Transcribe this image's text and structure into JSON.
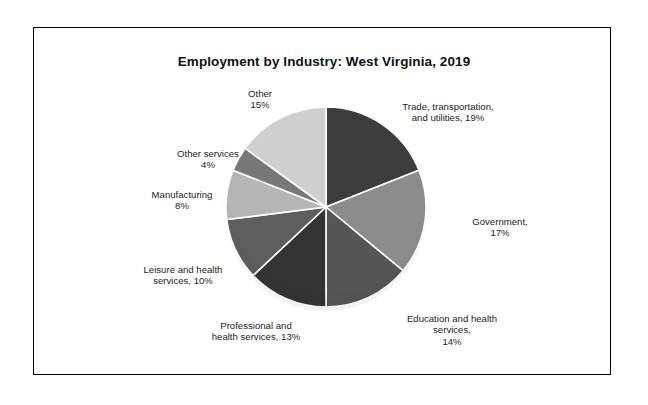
{
  "figure": {
    "title": "Employment by Industry: West Virginia, 2019",
    "background": "#ffffff",
    "border_color": "#000000"
  },
  "chart_data": {
    "type": "pie",
    "title": "Employment by Industry: West Virginia, 2019",
    "xlabel": "",
    "ylabel": "",
    "legend_position": "none",
    "label_style": "outside-radial",
    "start_angle_deg": 0,
    "direction": "clockwise",
    "units": "percent",
    "categories": [
      "Trade, transportation, and utilities",
      "Government",
      "Education and health services",
      "Professional and health services",
      "Leisure and health services",
      "Manufacturing",
      "Other services",
      "Other"
    ],
    "values": [
      19,
      17,
      14,
      13,
      10,
      8,
      4,
      15
    ],
    "total": 100,
    "colors": [
      "#3d3d3d",
      "#8c8c8c",
      "#565656",
      "#343434",
      "#5e5e5e",
      "#b5b5b5",
      "#787878",
      "#cfcfcf"
    ],
    "slice_labels": [
      "Trade, transportation,\nand utilities, 19%",
      "Government,\n17%",
      "Education and health\nservices,\n14%",
      "Professional and\nhealth services, 13%",
      "Leisure and health\nservices, 10%",
      "Manufacturing\n8%",
      "Other services\n4%",
      "Other\n15%"
    ],
    "slices": [
      {
        "name": "Trade, transportation, and utilities",
        "value": 19,
        "label": "Trade, transportation,\nand utilities, 19%",
        "color": "#3d3d3d"
      },
      {
        "name": "Government",
        "value": 17,
        "label": "Government,\n17%",
        "color": "#8c8c8c"
      },
      {
        "name": "Education and health services",
        "value": 14,
        "label": "Education and health\nservices,\n14%",
        "color": "#565656"
      },
      {
        "name": "Professional and health services",
        "value": 13,
        "label": "Professional and\nhealth services, 13%",
        "color": "#343434"
      },
      {
        "name": "Leisure and health services",
        "value": 10,
        "label": "Leisure and health\nservices, 10%",
        "color": "#5e5e5e"
      },
      {
        "name": "Manufacturing",
        "value": 8,
        "label": "Manufacturing\n8%",
        "color": "#b5b5b5"
      },
      {
        "name": "Other services",
        "value": 4,
        "label": "Other services\n4%",
        "color": "#787878"
      },
      {
        "name": "Other",
        "value": 15,
        "label": "Other\n15%",
        "color": "#cfcfcf"
      }
    ]
  }
}
